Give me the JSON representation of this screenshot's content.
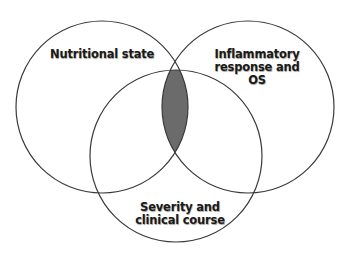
{
  "diagram": {
    "type": "venn",
    "sets": [
      {
        "id": "nutritional",
        "label_lines": [
          "Nutritional state"
        ]
      },
      {
        "id": "inflammatory",
        "label_lines": [
          "Inflammatory",
          "response and",
          "OS"
        ]
      },
      {
        "id": "severity",
        "label_lines": [
          "Severity and",
          "clinical course"
        ]
      }
    ],
    "highlighted_region": "intersection of all three sets",
    "colors": {
      "outline": "#3a3a3a",
      "highlight_fill": "#6b6b6b",
      "background": "#ffffff"
    }
  }
}
